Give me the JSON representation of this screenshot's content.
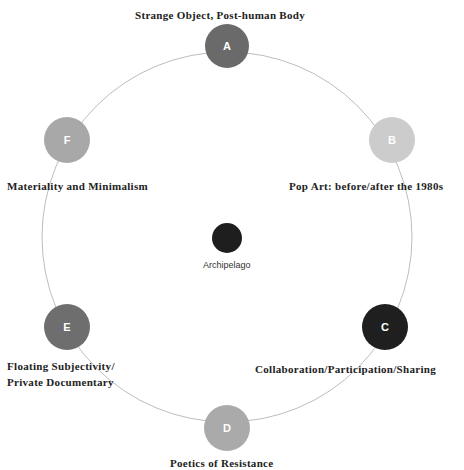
{
  "diagram": {
    "ring": {
      "cx": 227,
      "cy": 237,
      "r": 185,
      "color": "#bdbdbd"
    },
    "center": {
      "letter": "",
      "label": "Archipelago",
      "color": "#1e1e1e",
      "x": 227,
      "y": 238,
      "size": 30
    },
    "nodes": [
      {
        "id": "A",
        "letter": "A",
        "label": "Strange Object, Post-human Body",
        "color": "#6a6a6a",
        "x": 227,
        "y": 46,
        "size": 44
      },
      {
        "id": "B",
        "letter": "B",
        "label": "Pop Art: before/after the 1980s",
        "color": "#cccccc",
        "x": 392,
        "y": 140,
        "size": 46
      },
      {
        "id": "C",
        "letter": "C",
        "label": "Collaboration/Participation/Sharing",
        "color": "#1f1f1f",
        "x": 385,
        "y": 327,
        "size": 46
      },
      {
        "id": "D",
        "letter": "D",
        "label": "Poetics of Resistance",
        "color": "#aaaaaa",
        "x": 227,
        "y": 428,
        "size": 46
      },
      {
        "id": "E",
        "letter": "E",
        "label_line1": "Floating Subjectivity/",
        "label_line2": "Private Documentary",
        "color": "#6e6e6e",
        "x": 67,
        "y": 327,
        "size": 46
      },
      {
        "id": "F",
        "letter": "F",
        "label": "Materiality and Minimalism",
        "color": "#a8a8a8",
        "x": 67,
        "y": 140,
        "size": 46
      }
    ]
  }
}
